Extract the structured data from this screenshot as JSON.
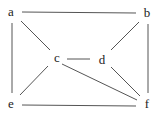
{
  "graph": {
    "nodes": [
      {
        "id": "a",
        "label": "a",
        "x": 11,
        "y": 12
      },
      {
        "id": "b",
        "label": "b",
        "x": 147,
        "y": 13
      },
      {
        "id": "c",
        "label": "c",
        "x": 57,
        "y": 58
      },
      {
        "id": "d",
        "label": "d",
        "x": 102,
        "y": 60
      },
      {
        "id": "e",
        "label": "e",
        "x": 11,
        "y": 104
      },
      {
        "id": "f",
        "label": "f",
        "x": 147,
        "y": 104
      }
    ],
    "edges": [
      {
        "from": "a",
        "to": "b",
        "x1": 22,
        "y1": 12,
        "x2": 136,
        "y2": 13
      },
      {
        "from": "a",
        "to": "c",
        "x1": 21,
        "y1": 21,
        "x2": 50,
        "y2": 50
      },
      {
        "from": "a",
        "to": "e",
        "x1": 12,
        "y1": 23,
        "x2": 12,
        "y2": 93
      },
      {
        "from": "b",
        "to": "d",
        "x1": 139,
        "y1": 22,
        "x2": 111,
        "y2": 50
      },
      {
        "from": "b",
        "to": "f",
        "x1": 148,
        "y1": 24,
        "x2": 148,
        "y2": 93
      },
      {
        "from": "c",
        "to": "d",
        "x1": 67,
        "y1": 59,
        "x2": 90,
        "y2": 59
      },
      {
        "from": "c",
        "to": "e",
        "x1": 48,
        "y1": 66,
        "x2": 20,
        "y2": 95
      },
      {
        "from": "c",
        "to": "f",
        "x1": 62,
        "y1": 64,
        "x2": 137,
        "y2": 100
      },
      {
        "from": "d",
        "to": "f",
        "x1": 111,
        "y1": 67,
        "x2": 140,
        "y2": 96
      },
      {
        "from": "e",
        "to": "f",
        "x1": 22,
        "y1": 105,
        "x2": 136,
        "y2": 106
      }
    ]
  }
}
